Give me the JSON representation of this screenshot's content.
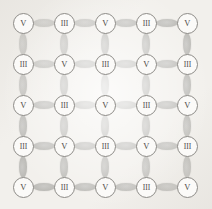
{
  "figure": {
    "name": "alternating-valence-square-lattice",
    "width": 212,
    "height": 209,
    "background_color": "#f2f0ec",
    "site_fill_color": "#fbfaf8",
    "site_stroke_color": "#8d8b87",
    "bond_color": "#c3c2bf",
    "label_color": "#4a4846",
    "grid": {
      "rows": 5,
      "cols": 5,
      "spacing_px": 41,
      "origin_x": 23,
      "origin_y": 23
    },
    "site_radius_px": 10,
    "bond_length_px": 22,
    "bond_width_px": 8
  },
  "legend": {
    "labels": [
      "V",
      "III"
    ]
  },
  "sites": [
    [
      {
        "label": "V",
        "row": 0,
        "col": 0
      },
      {
        "label": "III",
        "row": 0,
        "col": 1
      },
      {
        "label": "V",
        "row": 0,
        "col": 2
      },
      {
        "label": "III",
        "row": 0,
        "col": 3
      },
      {
        "label": "V",
        "row": 0,
        "col": 4
      }
    ],
    [
      {
        "label": "III",
        "row": 1,
        "col": 0
      },
      {
        "label": "V",
        "row": 1,
        "col": 1
      },
      {
        "label": "III",
        "row": 1,
        "col": 2
      },
      {
        "label": "V",
        "row": 1,
        "col": 3
      },
      {
        "label": "III",
        "row": 1,
        "col": 4
      }
    ],
    [
      {
        "label": "V",
        "row": 2,
        "col": 0
      },
      {
        "label": "III",
        "row": 2,
        "col": 1
      },
      {
        "label": "V",
        "row": 2,
        "col": 2
      },
      {
        "label": "III",
        "row": 2,
        "col": 3
      },
      {
        "label": "V",
        "row": 2,
        "col": 4
      }
    ],
    [
      {
        "label": "III",
        "row": 3,
        "col": 0
      },
      {
        "label": "V",
        "row": 3,
        "col": 1
      },
      {
        "label": "III",
        "row": 3,
        "col": 2
      },
      {
        "label": "V",
        "row": 3,
        "col": 3
      },
      {
        "label": "III",
        "row": 3,
        "col": 4
      }
    ],
    [
      {
        "label": "V",
        "row": 4,
        "col": 0
      },
      {
        "label": "III",
        "row": 4,
        "col": 1
      },
      {
        "label": "V",
        "row": 4,
        "col": 2
      },
      {
        "label": "III",
        "row": 4,
        "col": 3
      },
      {
        "label": "V",
        "row": 4,
        "col": 4
      }
    ]
  ]
}
